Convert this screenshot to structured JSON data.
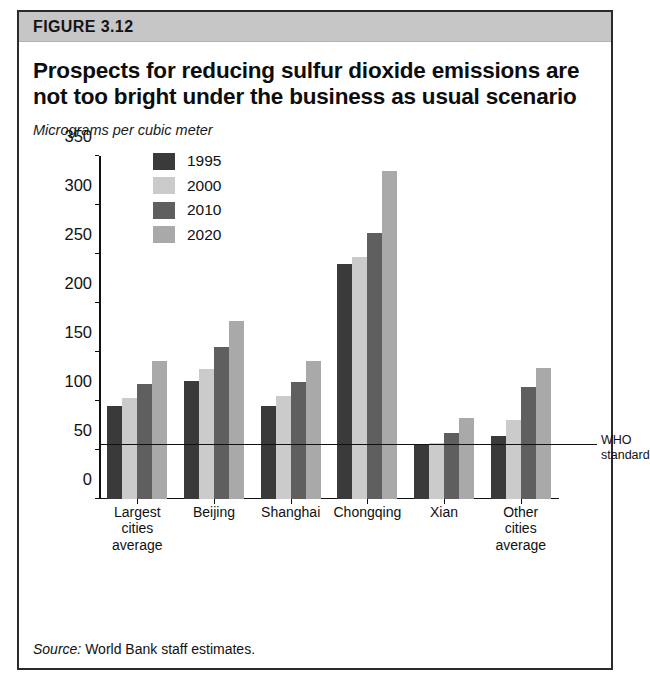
{
  "figure": {
    "band_label": "FIGURE 3.12",
    "title": "Prospects for reducing sulfur dioxide emissions are not too bright under the business as usual scenario",
    "subtitle": "Micrograms per cubic meter",
    "source_prefix": "Source:",
    "source_text": "World Bank staff estimates."
  },
  "annotation": {
    "who_line_1": "WHO",
    "who_line_2": "standard",
    "who_value": 55
  },
  "colors": {
    "series_1995": "#3a3a3a",
    "series_2000": "#cbcbcb",
    "series_2010": "#5f5f5f",
    "series_2020": "#a9a9a9",
    "band": "#c6c6c6",
    "axis": "#111111",
    "frame": "#2b2b2b"
  },
  "chart_data": {
    "type": "bar",
    "title": "Prospects for reducing sulfur dioxide emissions are not too bright under the business as usual scenario",
    "subtitle": "Micrograms per cubic meter",
    "xlabel": "",
    "ylabel": "Micrograms per cubic meter",
    "ylim": [
      0,
      350
    ],
    "yticks": [
      0,
      50,
      100,
      150,
      200,
      250,
      300,
      350
    ],
    "grid": false,
    "legend_position": "top-left-inside",
    "categories": [
      [
        "Largest",
        "cities",
        "average"
      ],
      [
        "Beijing"
      ],
      [
        "Shanghai"
      ],
      [
        "Chongqing"
      ],
      [
        "Xian"
      ],
      [
        "Other",
        "cities",
        "average"
      ]
    ],
    "category_labels": [
      "Largest cities average",
      "Beijing",
      "Shanghai",
      "Chongqing",
      "Xian",
      "Other cities average"
    ],
    "series": [
      {
        "name": "1995",
        "color": "#3a3a3a",
        "values": [
          95,
          121,
          95,
          240,
          55,
          64
        ]
      },
      {
        "name": "2000",
        "color": "#cbcbcb",
        "values": [
          103,
          133,
          105,
          247,
          57,
          81
        ]
      },
      {
        "name": "2010",
        "color": "#5f5f5f",
        "values": [
          118,
          155,
          120,
          272,
          68,
          115
        ]
      },
      {
        "name": "2020",
        "color": "#a9a9a9",
        "values": [
          141,
          182,
          141,
          335,
          83,
          134
        ]
      }
    ],
    "reference_line": {
      "label": "WHO standard",
      "value": 55
    }
  }
}
